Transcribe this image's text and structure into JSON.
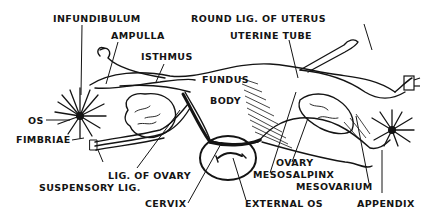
{
  "diagram": {
    "colors": {
      "ink": "#141414",
      "background": "#ffffff"
    },
    "labels": {
      "infundibulum": "INFUNDIBULUM",
      "ampulla": "AMPULLA",
      "isthmus": "ISTHMUS",
      "round_lig": "ROUND LIG. OF UTERUS",
      "uterine_tube": "UTERINE TUBE",
      "fundus": "FUNDUS",
      "body": "BODY",
      "os": "OS",
      "fimbriae": "FIMBRIAE",
      "lig_of_ovary": "LIG. OF OVARY",
      "suspensory_lig": "SUSPENSORY LIG.",
      "cervix": "CERVIX",
      "external_os": "EXTERNAL OS",
      "ovary": "OVARY",
      "mesosalpinx": "MESOSALPINX",
      "mesovarium": "MESOVARIUM",
      "appendix": "APPENDIX"
    }
  }
}
